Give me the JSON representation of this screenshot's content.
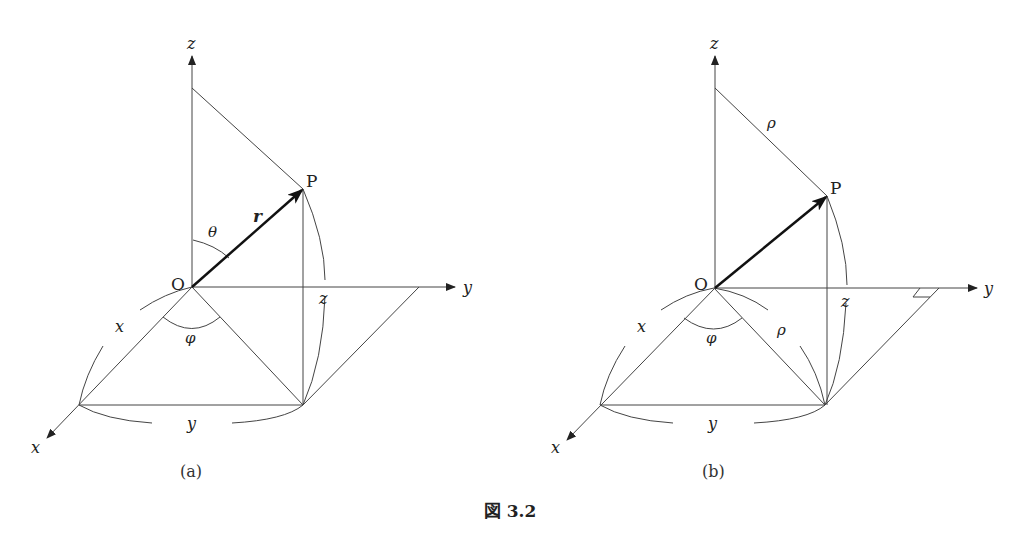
{
  "figure": {
    "caption": "図 3.2",
    "header_fragment": "3.2  極  座  標",
    "page_number": "45"
  },
  "panels": [
    {
      "id": "a",
      "label": "(a)",
      "axes": {
        "x": "x",
        "y": "y",
        "z": "z"
      },
      "origin": "O",
      "point": "P",
      "vector_label": "r",
      "angle_polar": "θ",
      "angle_azimuth": "φ",
      "edge_labels": {
        "x": "x",
        "y": "y",
        "z": "z"
      }
    },
    {
      "id": "b",
      "label": "(b)",
      "axes": {
        "x": "x",
        "y": "y",
        "z": "z"
      },
      "origin": "O",
      "point": "P",
      "rho_top": "ρ",
      "rho_base": "ρ",
      "angle_azimuth": "φ",
      "edge_labels": {
        "x": "x",
        "y": "y",
        "z": "z"
      }
    }
  ]
}
